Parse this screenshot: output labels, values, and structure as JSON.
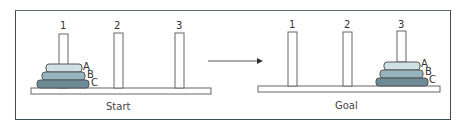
{
  "figure": {
    "panels": [
      {
        "caption": "Start",
        "pegs": [
          "1",
          "2",
          "3"
        ],
        "disks": [
          {
            "label": "A",
            "peg": "1",
            "color": "#cfe0e6"
          },
          {
            "label": "B",
            "peg": "1",
            "color": "#97b5bf"
          },
          {
            "label": "C",
            "peg": "1",
            "color": "#6c8b97"
          }
        ]
      },
      {
        "caption": "Goal",
        "pegs": [
          "1",
          "2",
          "3"
        ],
        "disks": [
          {
            "label": "A",
            "peg": "3",
            "color": "#cfe0e6"
          },
          {
            "label": "B",
            "peg": "3",
            "color": "#97b5bf"
          },
          {
            "label": "C",
            "peg": "3",
            "color": "#6c8b97"
          }
        ]
      }
    ],
    "colors": {
      "frame": "#3d4c55",
      "outline": "#555555",
      "disk_small": "#cfe0e6",
      "disk_medium": "#97b5bf",
      "disk_large": "#6c8b97"
    }
  }
}
